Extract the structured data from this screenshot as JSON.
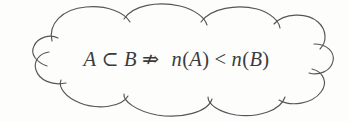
{
  "figure": {
    "kind": "hand-drawn cloud callout with mathematical statement",
    "background_color": "#fdfdfc",
    "stroke_color": "#55555a",
    "text_color": "#3b3b3d",
    "cloud_label": "cloud-outline",
    "formula": {
      "full_text": "A ⊂ B ⇏  n(A) < n(B)",
      "left_set": "A",
      "subset_symbol": "⊂",
      "right_set": "B",
      "not_implies_symbol": "⇏",
      "cardinality_fn": "n",
      "open_paren": "(",
      "close_paren": ")",
      "less_than_symbol": "<",
      "left_cardinality_arg": "A",
      "right_cardinality_arg": "B",
      "reading": "A is a subset of B does not imply n(A) is less than n(B)"
    }
  }
}
